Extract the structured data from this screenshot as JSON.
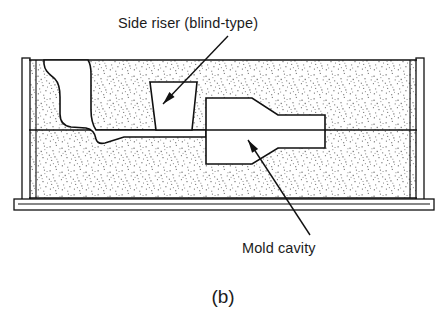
{
  "figure": {
    "caption": "(b)",
    "title_implied": "Sand casting mold cross-section with side riser",
    "background_color": "#ffffff",
    "line_color": "#111111",
    "sand_color": "#8a8a8a"
  },
  "annotations": [
    {
      "id": "side-riser",
      "label": "Side riser (blind-type)",
      "text_x": 118,
      "text_y": 28,
      "leader": {
        "x1": 228,
        "y1": 36,
        "x2": 163,
        "y2": 104
      },
      "arrow_at": "end"
    },
    {
      "id": "mold-cavity",
      "label": "Mold cavity",
      "text_x": 242,
      "text_y": 253,
      "leader": {
        "x1": 310,
        "y1": 235,
        "x2": 248,
        "y2": 140
      },
      "arrow_at": "end"
    }
  ],
  "geometry": {
    "flask": {
      "outer_left": 22,
      "outer_right": 424,
      "top": 60,
      "bottom": 198,
      "wall_thickness": 7,
      "parting_line_y": 130
    },
    "baseplate": {
      "left": 14,
      "right": 434,
      "top": 198,
      "bottom": 209
    },
    "riser": {
      "description": "blind-type side riser, trapezoidal, wider at top",
      "top_left_x": 150,
      "top_right_x": 197,
      "top_y": 82,
      "bottom_left_x": 156,
      "bottom_right_x": 192,
      "bottom_y": 130
    },
    "cavity": {
      "description": "stepped cylindrical casting: large diameter section stepping down to smaller diameter",
      "left_x": 206,
      "big_top_y": 98,
      "big_bottom_y": 164,
      "taper_start_x": 252,
      "taper_end_x": 278,
      "small_top_y": 115,
      "small_bottom_y": 148,
      "right_x": 325
    },
    "sprue": {
      "description": "pouring basin and downsprue at left, runner to parting line with well",
      "basin_top_y": 60,
      "sprue_x_left": 44,
      "sprue_x_right": 97,
      "well_bottom_y": 143,
      "runner_right_x": 206
    },
    "sand_texture": {
      "style": "fine random stipple dots",
      "dot_color": "#7d7d7d",
      "region": "inside flask walls, outside cavity/riser/sprue"
    }
  },
  "parts": [
    {
      "name": "cope",
      "position": "above parting line"
    },
    {
      "name": "drag",
      "position": "below parting line"
    },
    {
      "name": "flask wall",
      "position": "left and right vertical"
    },
    {
      "name": "base plate",
      "position": "bottom"
    },
    {
      "name": "molding sand",
      "position": "fill"
    }
  ]
}
